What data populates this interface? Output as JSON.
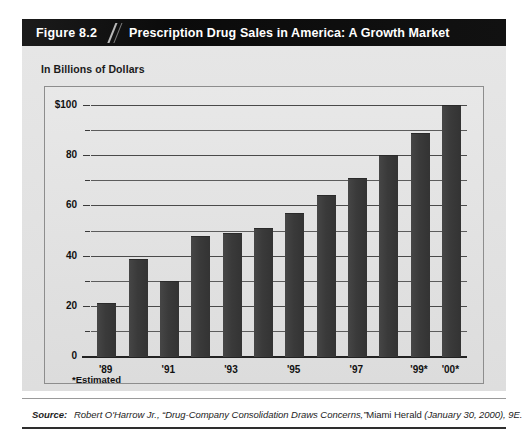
{
  "figure": {
    "number": "Figure 8.2",
    "title": "Prescription Drug Sales in America: A Growth Market",
    "axis_title": "In Billions of Dollars",
    "estimated_note": "*Estimated"
  },
  "source": {
    "label": "Source:",
    "author": "Robert O'Harrow Jr.,",
    "article": "“Drug-Company Consolidation Draws Concerns,”",
    "publication": "Miami Herald",
    "date": "(January 30, 2000), 9E."
  },
  "colors": {
    "bar": "#3d3d3d",
    "title_bar": "#111111",
    "panel": "#e2e2e2",
    "plot": "#e3e3e3",
    "gridline": "#4a4a4a"
  },
  "chart_data": {
    "type": "bar",
    "title": "Prescription Drug Sales in America: A Growth Market",
    "subtitle": "",
    "xlabel": "",
    "ylabel": "In Billions of Dollars",
    "ylim": [
      0,
      100
    ],
    "grid": true,
    "legend": "none",
    "categories": [
      "'89",
      "'90",
      "'91",
      "'92",
      "'93",
      "'94",
      "'95",
      "'96",
      "'97",
      "'98",
      "'99*",
      "'00*"
    ],
    "values": [
      21,
      38.5,
      30,
      48,
      49,
      51,
      57,
      64,
      71,
      80,
      89,
      100
    ],
    "tick_labels_shown": [
      "'89",
      "'91",
      "'93",
      "'95",
      "'97",
      "'99*",
      "'00*"
    ],
    "y_major_ticks": [
      0,
      20,
      40,
      60,
      80,
      100
    ],
    "y_major_tick_labels": [
      "0",
      "20",
      "40",
      "60",
      "80",
      "$100"
    ],
    "y_minor_gridlines": [
      10,
      30,
      50,
      70,
      90
    ],
    "annotations": [
      "*Estimated"
    ]
  }
}
